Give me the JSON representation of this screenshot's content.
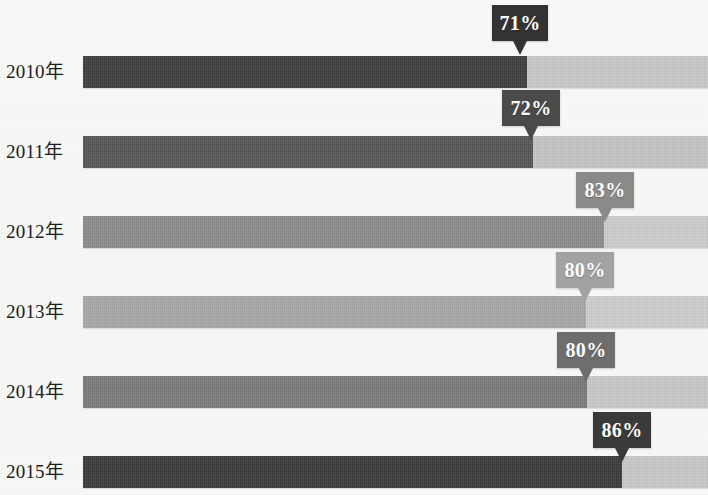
{
  "chart_data": {
    "type": "bar",
    "subtype": "stacked-horizontal-100pct",
    "title": "",
    "subtitle": "",
    "xlabel": "",
    "ylabel": "",
    "grid": false,
    "legend": null,
    "xlim": [
      0,
      100
    ],
    "orientation": "horizontal",
    "categories": [
      "2010年",
      "2011年",
      "2012年",
      "2013年",
      "2014年",
      "2015年"
    ],
    "series": [
      {
        "name": "主段",
        "values": [
          71,
          72,
          83,
          80,
          80,
          86
        ]
      },
      {
        "name": "余段",
        "values": [
          29,
          28,
          17,
          20,
          20,
          14
        ]
      }
    ],
    "data_labels": [
      "71%",
      "72%",
      "83%",
      "80%",
      "80%",
      "86%"
    ],
    "annotations": [
      {
        "category": "2010年",
        "label": "71%"
      },
      {
        "category": "2011年",
        "label": "72%"
      },
      {
        "category": "2012年",
        "label": "83%"
      },
      {
        "category": "2013年",
        "label": "80%"
      },
      {
        "category": "2014年",
        "label": "80%"
      },
      {
        "category": "2015年",
        "label": "86%"
      }
    ]
  },
  "rows": [
    {
      "year": "2010年",
      "value_label": "71%",
      "value": 71,
      "top": 46,
      "bar_top": 56,
      "left_width": 444,
      "left_color": "#3f3f3f",
      "right_color": "#c9c9c9",
      "callout": {
        "left": 492,
        "top": 5,
        "width": 56,
        "bg": "#333333"
      }
    },
    {
      "year": "2011年",
      "value_label": "72%",
      "value": 72,
      "top": 126,
      "bar_top": 136,
      "left_width": 450,
      "left_color": "#575757",
      "right_color": "#c6c6c6",
      "callout": {
        "left": 502,
        "top": 90,
        "width": 58,
        "bg": "#4a4a4a"
      }
    },
    {
      "year": "2012年",
      "value_label": "83%",
      "value": 83,
      "top": 206,
      "bar_top": 216,
      "left_width": 521,
      "left_color": "#8c8c8c",
      "right_color": "#cdcdcd",
      "callout": {
        "left": 576,
        "top": 172,
        "width": 58,
        "bg": "#8a8a8a"
      }
    },
    {
      "year": "2013年",
      "value_label": "80%",
      "value": 80,
      "top": 286,
      "bar_top": 296,
      "left_width": 503,
      "left_color": "#a8a8a8",
      "right_color": "#cfcfcf",
      "callout": {
        "left": 556,
        "top": 252,
        "width": 58,
        "bg": "#a2a2a2"
      }
    },
    {
      "year": "2014年",
      "value_label": "80%",
      "value": 80,
      "top": 366,
      "bar_top": 376,
      "left_width": 504,
      "left_color": "#7b7b7b",
      "right_color": "#c9c9c9",
      "callout": {
        "left": 557,
        "top": 332,
        "width": 58,
        "bg": "#6e6e6e"
      }
    },
    {
      "year": "2015年",
      "value_label": "86%",
      "value": 86,
      "top": 446,
      "bar_top": 456,
      "left_width": 539,
      "left_color": "#3c3c3c",
      "right_color": "#c9c9c9",
      "callout": {
        "left": 593,
        "top": 412,
        "width": 58,
        "bg": "#3a3a3a"
      }
    }
  ],
  "colors": {
    "background": "#f7f7f5",
    "label_text": "#1d1d1d",
    "callout_text": "#ffffff"
  }
}
